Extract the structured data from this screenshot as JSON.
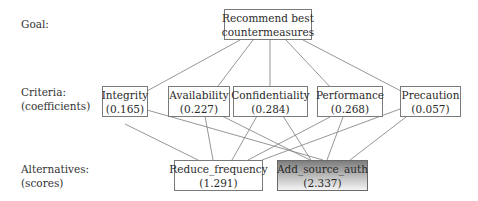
{
  "row_labels": {
    "goal": "Goal:",
    "criteria_line1": "Criteria:",
    "criteria_line2": "(coefficients)",
    "alternatives_line1": "Alternatives:",
    "alternatives_line2": "(scores)"
  },
  "goal": {
    "line1": "Recommend best",
    "line2": "countermeasures"
  },
  "criteria": [
    {
      "name": "Integrity",
      "coefficient": "(0.165)"
    },
    {
      "name": "Availability",
      "coefficient": "(0.227)"
    },
    {
      "name": "Confidentiality",
      "coefficient": "(0.284)"
    },
    {
      "name": "Performance",
      "coefficient": "(0.268)"
    },
    {
      "name": "Precaution",
      "coefficient": "(0.057)"
    }
  ],
  "alternatives": [
    {
      "name": "Reduce_frequency",
      "score": "(1.291)",
      "highlighted": false
    },
    {
      "name": "Add_source_auth",
      "score": "(2.337)",
      "highlighted": true
    }
  ],
  "colors": {
    "edge": "#8a8a8a",
    "border": "#7a7a7a",
    "highlight_gradient_top": "#7d7d7d",
    "highlight_gradient_bottom": "#f4f4f4"
  }
}
